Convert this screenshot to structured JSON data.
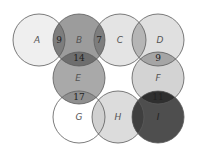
{
  "diagram": {
    "type": "overlapping-circles",
    "radius": 26,
    "circles": [
      {
        "id": "A",
        "label": "A",
        "cx": 39,
        "cy": 40,
        "fill": "#efefef"
      },
      {
        "id": "B",
        "label": "B",
        "cx": 79,
        "cy": 40,
        "fill": "#9c9c9c"
      },
      {
        "id": "C",
        "label": "C",
        "cx": 120,
        "cy": 40,
        "fill": "#e4e4e4"
      },
      {
        "id": "D",
        "label": "D",
        "cx": 158,
        "cy": 40,
        "fill": "#e0e0e0"
      },
      {
        "id": "E",
        "label": "E",
        "cx": 79,
        "cy": 78,
        "fill": "#a9a9a9"
      },
      {
        "id": "F",
        "label": "F",
        "cx": 158,
        "cy": 78,
        "fill": "#d3d3d3"
      },
      {
        "id": "G",
        "label": "G",
        "cx": 79,
        "cy": 117,
        "fill": "#ffffff"
      },
      {
        "id": "H",
        "label": "H",
        "cx": 118,
        "cy": 117,
        "fill": "#dcdcdc"
      },
      {
        "id": "I",
        "label": "I",
        "cx": 158,
        "cy": 117,
        "fill": "#4e4e4e"
      }
    ],
    "overlaps": [
      {
        "between": [
          "A",
          "B"
        ],
        "value": "9",
        "x": 59,
        "y": 43,
        "fill": "#7d7d7d"
      },
      {
        "between": [
          "B",
          "C"
        ],
        "value": "7",
        "x": 99,
        "y": 43,
        "fill": "#7d7d7d"
      },
      {
        "between": [
          "C",
          "D"
        ],
        "value": "",
        "x": 139,
        "y": 43,
        "fill": "#b5b5b5"
      },
      {
        "between": [
          "B",
          "E"
        ],
        "value": "14",
        "x": 79,
        "y": 62,
        "fill": "#6e6e6e"
      },
      {
        "between": [
          "D",
          "F"
        ],
        "value": "9",
        "x": 158,
        "y": 62,
        "fill": "#a5a5a5"
      },
      {
        "between": [
          "E",
          "G"
        ],
        "value": "17",
        "x": 79,
        "y": 101,
        "fill": "#8f8f8f"
      },
      {
        "between": [
          "F",
          "I"
        ],
        "value": "11",
        "x": 158,
        "y": 101,
        "fill": "#2f2f2f"
      },
      {
        "between": [
          "G",
          "H"
        ],
        "value": "",
        "x": 99,
        "y": 120,
        "fill": "#d0d0d0"
      },
      {
        "between": [
          "H",
          "I"
        ],
        "value": "",
        "x": 138,
        "y": 120,
        "fill": "#3f3f3f"
      }
    ]
  }
}
